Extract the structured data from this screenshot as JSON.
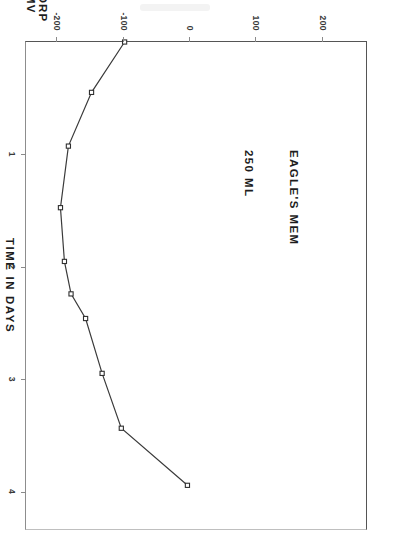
{
  "figure": {
    "caption_line1": "EAGLE'S MEM",
    "caption_line2": "250 ML",
    "caption": "EAGLE'S MEM\n250 ML"
  },
  "chart_data": {
    "type": "line",
    "title": "EAGLE'S MEM 250 ML",
    "xlabel": "TIME IN DAYS",
    "ylabel": "ORP MV",
    "ylabel_line1": "ORP",
    "ylabel_line2": "MV",
    "xlim": [
      0,
      4.35
    ],
    "ylim": [
      -250,
      265
    ],
    "grid": false,
    "legend": null,
    "marker": "open-square",
    "xticks": [
      1,
      2,
      3,
      4
    ],
    "xtick_labels": [
      "1",
      "2",
      "3",
      "4"
    ],
    "yticks": [
      200,
      100,
      0,
      -100,
      -200
    ],
    "ytick_labels": [
      "200",
      "100",
      "0",
      "-100",
      "-200"
    ],
    "x": [
      0.0,
      0.45,
      0.93,
      1.48,
      1.96,
      2.25,
      2.47,
      2.96,
      3.45,
      3.96
    ],
    "y": [
      -100,
      -150,
      -185,
      -197,
      -191,
      -181,
      -159,
      -134,
      -105,
      -5
    ],
    "points": [
      {
        "x": 0.0,
        "y": -100
      },
      {
        "x": 0.45,
        "y": -150
      },
      {
        "x": 0.93,
        "y": -185
      },
      {
        "x": 1.48,
        "y": -197
      },
      {
        "x": 1.96,
        "y": -191
      },
      {
        "x": 2.25,
        "y": -181
      },
      {
        "x": 2.47,
        "y": -159
      },
      {
        "x": 2.96,
        "y": -134
      },
      {
        "x": 3.45,
        "y": -105
      },
      {
        "x": 3.96,
        "y": -5
      }
    ]
  },
  "colors": {
    "line": "#3a3a3a",
    "marker_fill": "#ffffff",
    "marker_stroke": "#2f2f2f",
    "axis": "#555555",
    "text": "#1d1d1d",
    "background": "#ffffff"
  }
}
